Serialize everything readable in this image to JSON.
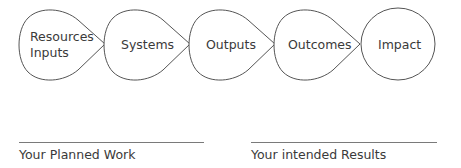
{
  "diagram": {
    "stages": [
      {
        "line1": "Resources",
        "line2": "Inputs"
      },
      {
        "line1": "Systems"
      },
      {
        "line1": "Outputs"
      },
      {
        "line1": "Outcomes"
      },
      {
        "line1": "Impact"
      }
    ],
    "captions": {
      "left": "Your Planned Work",
      "right": "Your intended Results"
    },
    "colors": {
      "stroke": "#555555",
      "text": "#3a3a3a",
      "rule": "#7a7a7a"
    }
  }
}
